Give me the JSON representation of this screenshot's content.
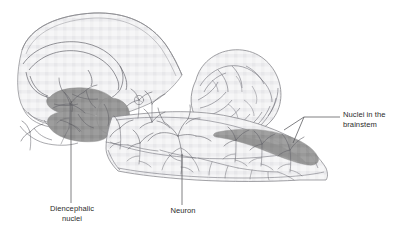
{
  "figure": {
    "type": "anatomical-line-diagram",
    "background_color": "#ffffff",
    "outline_color": "#8a8a8e",
    "tissue_fill_color": "#f4f4f5",
    "nuclei_fill_color": "#9b9b9b",
    "neuron_color": "#6d6d74",
    "leader_line_color": "#55555a",
    "label_text_color": "#2b2b2b"
  },
  "labels": [
    {
      "id": "diencephalic-nuclei",
      "text": "Diencephalic\nnuclei",
      "line1": "Diencephalic",
      "line2": "nuclei",
      "align": "center",
      "leader": "vertical"
    },
    {
      "id": "neuron",
      "text": "Neuron",
      "line1": "Neuron",
      "line2": "",
      "align": "center",
      "leader": "vertical"
    },
    {
      "id": "nuclei-in-the-brainstem",
      "text": "Nuclei in the\nbrainstem",
      "line1": "Nuclei in the",
      "line2": "brainstem",
      "align": "left",
      "leader": "forked-horizontal"
    }
  ],
  "structures": [
    {
      "id": "cerebral-hemisphere",
      "name": "Cerebral hemisphere (midsagittal)"
    },
    {
      "id": "corpus-callosum",
      "name": "Corpus callosum"
    },
    {
      "id": "cerebellum",
      "name": "Cerebellum"
    },
    {
      "id": "brainstem",
      "name": "Brainstem"
    },
    {
      "id": "diencephalic-nuclei-mass",
      "name": "Diencephalic nuclei"
    },
    {
      "id": "brainstem-nuclei-band",
      "name": "Nuclei in the brainstem"
    }
  ],
  "annotations": {
    "neuron_count_visible": 9,
    "nuclei_groups": 2
  }
}
